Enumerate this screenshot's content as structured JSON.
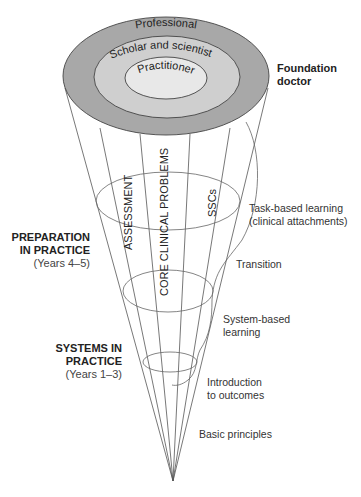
{
  "diagram": {
    "title": "",
    "rings": {
      "outer": {
        "label": "Professional",
        "fill": "#a8a8a8"
      },
      "middle": {
        "label": "Scholar and scientist",
        "fill": "#cfcfcf"
      },
      "inner": {
        "label": "Practitioner",
        "fill": "#e8e8e8"
      }
    },
    "top_right_label": {
      "line1": "Foundation",
      "line2": "doctor"
    },
    "themes": [
      "ASSESSMENT",
      "CORE CLINICAL PROBLEMS",
      "SSCs"
    ],
    "left_labels": [
      {
        "line1": "PREPARATION",
        "line2": "IN PRACTICE",
        "sub": "(Years 4–5)"
      },
      {
        "line1": "SYSTEMS IN",
        "line2": "PRACTICE",
        "sub": "(Years 1–3)"
      }
    ],
    "right_labels": [
      {
        "line1": "Task-based learning",
        "line2": "(clinical attachments)"
      },
      {
        "line1": "Transition",
        "line2": ""
      },
      {
        "line1": "System-based",
        "line2": "learning"
      },
      {
        "line1": "Introduction",
        "line2": "to outcomes"
      },
      {
        "line1": "Basic principles",
        "line2": ""
      }
    ],
    "colors": {
      "line": "#555555",
      "text": "#333333"
    }
  }
}
